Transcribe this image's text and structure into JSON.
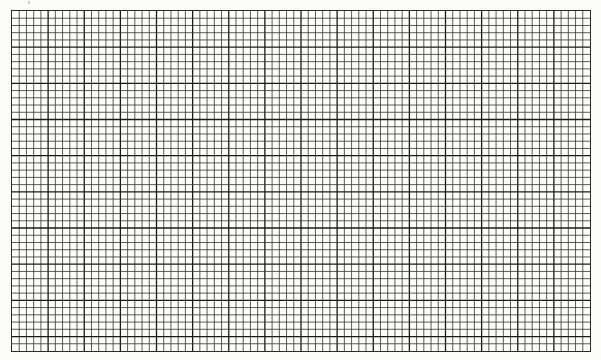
{
  "document": {
    "type": "graph paper",
    "grid": {
      "columns": 80,
      "rows": 47,
      "major_every": 5,
      "line_color": "#333333",
      "major_line_color": "#1a1a1a",
      "paper_color": "#fbfbf7"
    }
  }
}
